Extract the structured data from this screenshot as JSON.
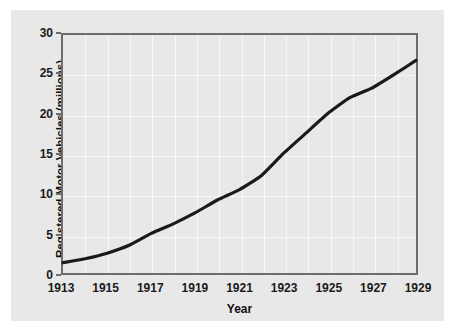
{
  "chart_data": {
    "type": "line",
    "title": "",
    "xlabel": "Year",
    "ylabel": "Registered Motor Vehicles (millions)",
    "xlim": [
      1913,
      1929
    ],
    "ylim": [
      0,
      30
    ],
    "grid": true,
    "legend": "none",
    "xticks": [
      "1913",
      "1915",
      "1917",
      "1919",
      "1921",
      "1923",
      "1925",
      "1927",
      "1929"
    ],
    "yticks": [
      "0",
      "5",
      "10",
      "15",
      "20",
      "25",
      "30"
    ],
    "x": [
      1913,
      1914,
      1915,
      1916,
      1917,
      1918,
      1919,
      1920,
      1921,
      1922,
      1923,
      1924,
      1925,
      1926,
      1927,
      1928,
      1929
    ],
    "series": [
      {
        "name": "Registered Motor Vehicles",
        "values": [
          1.3,
          1.8,
          2.5,
          3.5,
          5.0,
          6.2,
          7.6,
          9.2,
          10.5,
          12.3,
          15.1,
          17.6,
          20.1,
          22.1,
          23.3,
          25.0,
          26.8
        ]
      }
    ],
    "line_color": "#1a1a1a",
    "plot_background": "#e8e8e8",
    "gridline_color": "#f7f7f7",
    "axis_color": "#6d6d6d"
  },
  "figure": {
    "background": "#ffffff",
    "panel_background": "#e8e8e8"
  }
}
